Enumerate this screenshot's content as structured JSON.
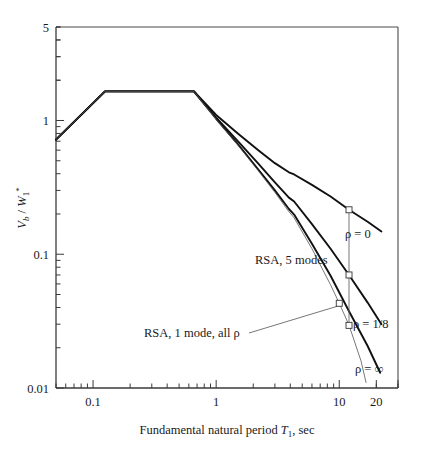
{
  "figure": {
    "background_color": "#ffffff",
    "line_color": "#111111",
    "thin_line_color": "#555555"
  },
  "chart_data": {
    "type": "line",
    "title": "",
    "xlabel": "Fundamental natural period T1, sec",
    "xlabel_parts": {
      "pre": "Fundamental natural period ",
      "symbol": "T",
      "sub": "1",
      "post": ", sec"
    },
    "ylabel": "Vb / W1*",
    "ylabel_parts": {
      "symbol1": "V",
      "sub1": "b",
      "slash": " / ",
      "symbol2": "W",
      "sub2": "1",
      "sup2": "*"
    },
    "xscale": "log",
    "yscale": "log",
    "xlim": [
      0.05,
      30
    ],
    "ylim": [
      0.01,
      5
    ],
    "grid": false,
    "legend_position": "inline-annotations",
    "xticks": [
      0.1,
      1,
      10,
      20
    ],
    "xtick_labels": [
      "0.1",
      "1",
      "10",
      "20"
    ],
    "yticks": [
      0.01,
      0.1,
      1,
      5
    ],
    "ytick_labels": [
      "0.01",
      "0.1",
      "1",
      "5"
    ],
    "series": [
      {
        "name": "rho = 0",
        "label": "ρ = 0",
        "style": "solid-thick",
        "x": [
          0.05,
          0.125,
          0.66,
          1.0,
          1.5,
          2.2,
          3.0,
          3.9,
          4.3,
          6.0,
          8.5,
          12.0,
          17.0,
          22.0
        ],
        "y": [
          0.72,
          1.65,
          1.65,
          1.1,
          0.8,
          0.6,
          0.48,
          0.41,
          0.395,
          0.33,
          0.27,
          0.215,
          0.175,
          0.148
        ]
      },
      {
        "name": "rho = 1/8",
        "label": "ρ = 1/8",
        "style": "solid-thick",
        "x": [
          0.05,
          0.125,
          0.66,
          1.0,
          1.5,
          2.2,
          3.0,
          3.9,
          4.3,
          6.0,
          8.5,
          12.0,
          17.0,
          22.0
        ],
        "y": [
          0.72,
          1.65,
          1.65,
          1.05,
          0.7,
          0.475,
          0.345,
          0.265,
          0.248,
          0.168,
          0.11,
          0.07,
          0.0435,
          0.03
        ]
      },
      {
        "name": "rho = infinity",
        "label": "ρ = ∞",
        "style": "solid-thick",
        "x": [
          0.05,
          0.125,
          0.66,
          1.0,
          1.5,
          2.2,
          3.0,
          3.9,
          4.3,
          6.0,
          8.5,
          12.0,
          17.0,
          21.5
        ],
        "y": [
          0.72,
          1.65,
          1.65,
          1.03,
          0.665,
          0.43,
          0.3,
          0.218,
          0.198,
          0.12,
          0.069,
          0.0375,
          0.0206,
          0.013
        ]
      },
      {
        "name": "RSA, 1 mode, all rho",
        "label": "RSA, 1 mode, all ρ",
        "style": "solid-thin",
        "x": [
          0.05,
          0.125,
          0.66,
          1.0,
          1.5,
          2.2,
          3.0,
          3.9,
          4.3,
          6.0,
          8.5,
          10.0,
          12.0,
          15.0,
          16.5
        ],
        "y": [
          0.72,
          1.65,
          1.65,
          1.02,
          0.655,
          0.42,
          0.29,
          0.208,
          0.187,
          0.11,
          0.059,
          0.043,
          0.0295,
          0.016,
          0.011
        ]
      }
    ],
    "annotations": [
      {
        "name": "rho-0-label",
        "text": "ρ = 0",
        "x_px": 345,
        "y_px": 238
      },
      {
        "name": "rsa-5-modes-label",
        "text": "RSA, 5 modes",
        "x_px": 255,
        "y_px": 264
      },
      {
        "name": "rho-1-8-label",
        "text": "ρ = 1/8",
        "x_px": 353,
        "y_px": 328
      },
      {
        "name": "rho-inf-label",
        "text": "ρ = ∞",
        "x_px": 355,
        "y_px": 373
      },
      {
        "name": "rsa-1-mode-label",
        "text": "RSA, 1 mode, all ρ",
        "x_px": 144,
        "y_px": 337
      }
    ],
    "markers": [
      {
        "name": "marker-rho-0",
        "x": 12.0,
        "y": 0.215
      },
      {
        "name": "marker-rho-1-8",
        "x": 12.0,
        "y": 0.07
      },
      {
        "name": "marker-rsa-5-modes",
        "x": 12.0,
        "y": 0.0294
      },
      {
        "name": "marker-rsa-1-mode",
        "x": 10.0,
        "y": 0.043
      }
    ]
  }
}
